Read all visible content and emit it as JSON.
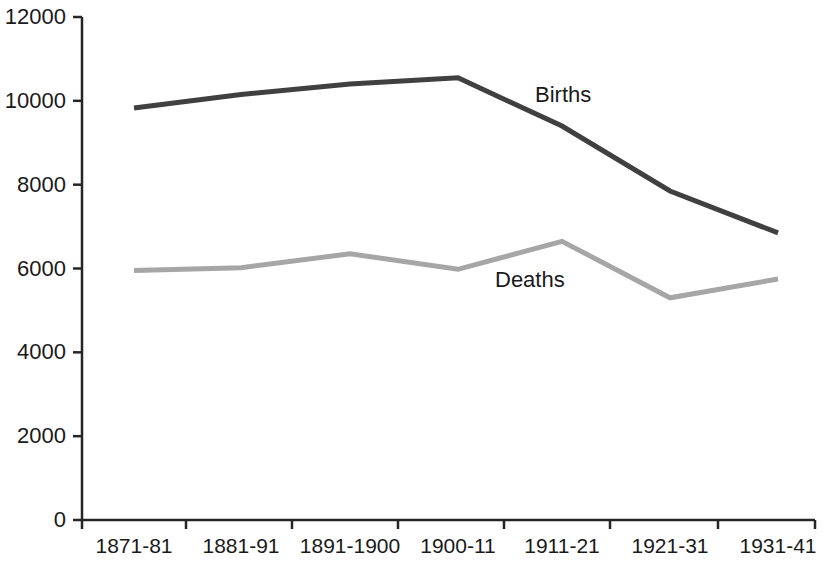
{
  "chart_data": {
    "type": "line",
    "title": "",
    "subtitle": "",
    "xlabel": "",
    "ylabel": "",
    "categories": [
      "1871-81",
      "1881-91",
      "1891-1900",
      "1900-11",
      "1911-21",
      "1921-31",
      "1931-41"
    ],
    "series": [
      {
        "name": "Births",
        "color": "#404040",
        "values": [
          9830,
          10150,
          10400,
          10550,
          9400,
          7850,
          6850
        ]
      },
      {
        "name": "Deaths",
        "color": "#a6a6a6",
        "values": [
          5950,
          6020,
          6350,
          5980,
          6650,
          5300,
          5750
        ]
      }
    ],
    "ylim": [
      0,
      12000
    ],
    "yticks": [
      0,
      2000,
      4000,
      6000,
      8000,
      10000,
      12000
    ],
    "ytick_labels": [
      "0",
      "2000",
      "4000",
      "6000",
      "8000",
      "10000",
      "12000"
    ],
    "grid": false,
    "legend_position": "inline-annotations",
    "annotations": [
      {
        "text": "Births",
        "series": "Births",
        "x_px": 535,
        "y_px": 84
      },
      {
        "text": "Deaths",
        "series": "Deaths",
        "x_px": 495,
        "y_px": 269
      }
    ],
    "axis_color": "#262626",
    "background": "#ffffff"
  }
}
